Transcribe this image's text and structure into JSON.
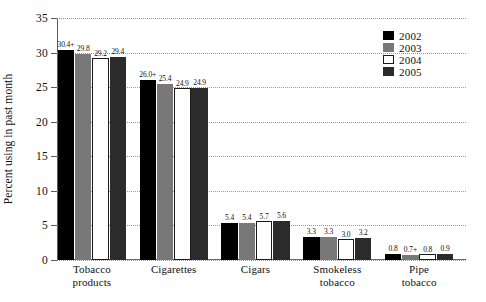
{
  "chart_data": {
    "type": "bar",
    "title": "",
    "xlabel": "",
    "ylabel": "Percent using in past month",
    "ylim": [
      0,
      35
    ],
    "ytick_step": 5,
    "yticks": [
      "0",
      "5",
      "10",
      "15",
      "20",
      "25",
      "30",
      "35"
    ],
    "grid": "horizontal-dotted",
    "legend_position": "top-right",
    "categories": [
      "Tobacco products",
      "Cigarettes",
      "Cigars",
      "Smokeless tobacco",
      "Pipe tobacco"
    ],
    "category_lines": [
      [
        "Tobacco",
        "products"
      ],
      [
        "Cigarettes"
      ],
      [
        "Cigars"
      ],
      [
        "Smokeless",
        "tobacco"
      ],
      [
        "Pipe",
        "tobacco"
      ]
    ],
    "series": [
      {
        "name": "2002",
        "color": "#000000",
        "values": [
          30.4,
          26.0,
          5.4,
          3.3,
          0.8
        ],
        "labels": [
          "30.4+",
          "26.0+",
          "5.4",
          "3.3",
          "0.8"
        ]
      },
      {
        "name": "2003",
        "color": "#787878",
        "values": [
          29.8,
          25.4,
          5.4,
          3.3,
          0.7
        ],
        "labels": [
          "29.8",
          "25.4",
          "5.4",
          "3.3",
          "0.7+"
        ]
      },
      {
        "name": "2004",
        "color": "#ffffff",
        "values": [
          29.2,
          24.9,
          5.7,
          3.0,
          0.8
        ],
        "labels": [
          "29.2",
          "24.9",
          "5.7",
          "3.0",
          "0.8"
        ]
      },
      {
        "name": "2005",
        "color": "#2b2b2b",
        "values": [
          29.4,
          24.9,
          5.6,
          3.2,
          0.9
        ],
        "labels": [
          "29.4",
          "24.9",
          "5.6",
          "3.2",
          "0.9"
        ]
      }
    ]
  }
}
